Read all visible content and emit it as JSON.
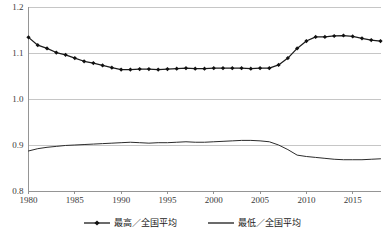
{
  "chart_data": {
    "type": "line",
    "title": "",
    "subtitle": "",
    "xlabel": "",
    "ylabel": "",
    "xlim": [
      1980,
      2018
    ],
    "ylim": [
      0.8,
      1.2
    ],
    "grid": true,
    "legend_position": "bottom",
    "y_ticks": [
      "0.8",
      "0.9",
      "1.0",
      "1.1",
      "1.2"
    ],
    "y_tick_values": [
      0.8,
      0.9,
      1.0,
      1.1,
      1.2
    ],
    "x_ticks": [
      "1980",
      "1985",
      "1990",
      "1995",
      "2000",
      "2005",
      "2010",
      "2015"
    ],
    "x_tick_values": [
      1980,
      1985,
      1990,
      1995,
      2000,
      2005,
      2010,
      2015
    ],
    "x": [
      1980,
      1981,
      1982,
      1983,
      1984,
      1985,
      1986,
      1987,
      1988,
      1989,
      1990,
      1991,
      1992,
      1993,
      1994,
      1995,
      1996,
      1997,
      1998,
      1999,
      2000,
      2001,
      2002,
      2003,
      2004,
      2005,
      2006,
      2007,
      2008,
      2009,
      2010,
      2011,
      2012,
      2013,
      2014,
      2015,
      2016,
      2017,
      2018
    ],
    "series": [
      {
        "name": "最高／全国平均",
        "marker": "diamond",
        "color": "#1b1b1b",
        "values": [
          1.134,
          1.117,
          1.11,
          1.101,
          1.096,
          1.089,
          1.082,
          1.078,
          1.073,
          1.068,
          1.064,
          1.064,
          1.065,
          1.065,
          1.064,
          1.065,
          1.066,
          1.067,
          1.066,
          1.066,
          1.067,
          1.067,
          1.067,
          1.067,
          1.066,
          1.067,
          1.067,
          1.074,
          1.089,
          1.11,
          1.126,
          1.135,
          1.135,
          1.137,
          1.138,
          1.136,
          1.132,
          1.128,
          1.126
        ]
      },
      {
        "name": "最低／全国平均",
        "marker": "none",
        "color": "#2b2b2b",
        "values": [
          0.887,
          0.892,
          0.895,
          0.897,
          0.899,
          0.9,
          0.901,
          0.902,
          0.903,
          0.904,
          0.905,
          0.906,
          0.905,
          0.904,
          0.905,
          0.905,
          0.906,
          0.907,
          0.906,
          0.906,
          0.907,
          0.908,
          0.909,
          0.91,
          0.91,
          0.909,
          0.907,
          0.9,
          0.89,
          0.878,
          0.875,
          0.873,
          0.871,
          0.869,
          0.868,
          0.868,
          0.868,
          0.869,
          0.87
        ]
      }
    ],
    "legend": [
      {
        "label": "最高／全国平均",
        "marker": "diamond"
      },
      {
        "label": "最低／全国平均",
        "marker": "none"
      }
    ]
  }
}
